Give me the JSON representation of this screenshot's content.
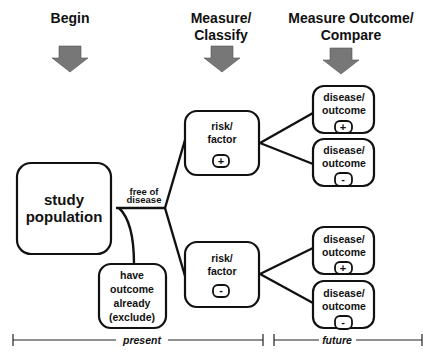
{
  "headers": {
    "begin": "Begin",
    "measure_line1": "Measure/",
    "measure_line2": "Classify",
    "outcome_line1": "Measure Outcome/",
    "outcome_line2": "Compare"
  },
  "nodes": {
    "study_population": {
      "line1": "study",
      "line2": "population"
    },
    "free_of_disease": {
      "line1": "free of",
      "line2": "disease"
    },
    "excluded": {
      "line1": "have",
      "line2": "outcome",
      "line3": "already",
      "line4": "(exclude)"
    },
    "risk_positive": {
      "line1": "risk/",
      "line2": "factor",
      "sign": "+"
    },
    "risk_negative": {
      "line1": "risk/",
      "line2": "factor",
      "sign": "-"
    },
    "outcomes": [
      {
        "line1": "disease/",
        "line2": "outcome",
        "sign": "+"
      },
      {
        "line1": "disease/",
        "line2": "outcome",
        "sign": "-"
      },
      {
        "line1": "disease/",
        "line2": "outcome",
        "sign": "+"
      },
      {
        "line1": "disease/",
        "line2": "outcome",
        "sign": "-"
      }
    ]
  },
  "timeline": {
    "present": "present",
    "future": "future"
  },
  "colors": {
    "arrow": "#777777",
    "line": "#111111"
  }
}
